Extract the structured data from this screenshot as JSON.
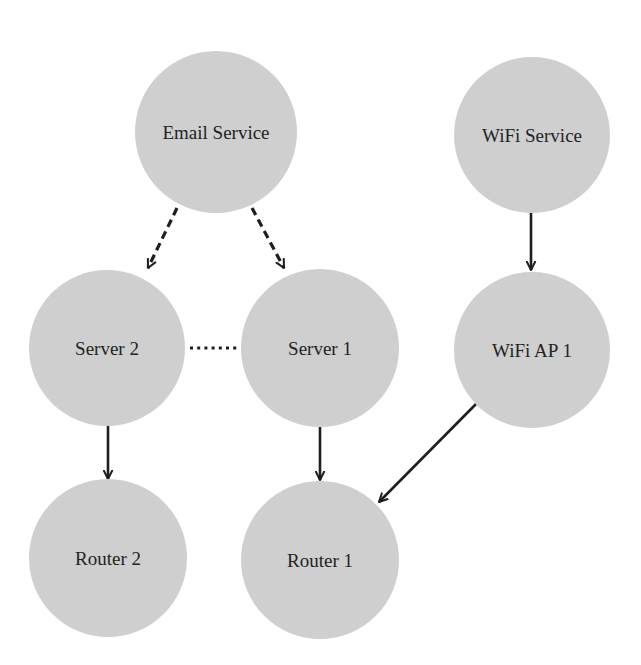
{
  "diagram": {
    "type": "directed-graph",
    "colors": {
      "background": "#ffffff",
      "node_fill": "#cfcfcf",
      "text": "#232323",
      "edge": "#1e1e1e"
    },
    "nodes": [
      {
        "id": "email",
        "label": "Email Service",
        "cx": 216,
        "cy": 132,
        "r": 81
      },
      {
        "id": "wifi_service",
        "label": "WiFi Service",
        "cx": 532,
        "cy": 135,
        "r": 78
      },
      {
        "id": "server2",
        "label": "Server 2",
        "cx": 107,
        "cy": 348,
        "r": 78
      },
      {
        "id": "server1",
        "label": "Server 1",
        "cx": 320,
        "cy": 348,
        "r": 79
      },
      {
        "id": "wifi_ap1",
        "label": "WiFi AP 1",
        "cx": 532,
        "cy": 350,
        "r": 78
      },
      {
        "id": "router2",
        "label": "Router 2",
        "cx": 108,
        "cy": 558,
        "r": 79
      },
      {
        "id": "router1",
        "label": "Router 1",
        "cx": 320,
        "cy": 560,
        "r": 79
      }
    ],
    "edges": [
      {
        "from": "email",
        "to": "server2",
        "style": "dashed",
        "directed": true,
        "x1": 177,
        "y1": 208,
        "x2": 148,
        "y2": 268
      },
      {
        "from": "email",
        "to": "server1",
        "style": "dashed",
        "directed": true,
        "x1": 252,
        "y1": 208,
        "x2": 284,
        "y2": 268
      },
      {
        "from": "server2",
        "to": "server1",
        "style": "dotted",
        "directed": false,
        "x1": 190,
        "y1": 348,
        "x2": 240,
        "y2": 348
      },
      {
        "from": "wifi_service",
        "to": "wifi_ap1",
        "style": "solid",
        "directed": true,
        "x1": 531,
        "y1": 213,
        "x2": 531,
        "y2": 270
      },
      {
        "from": "server2",
        "to": "router2",
        "style": "solid",
        "directed": true,
        "x1": 108,
        "y1": 426,
        "x2": 108,
        "y2": 479
      },
      {
        "from": "server1",
        "to": "router1",
        "style": "solid",
        "directed": true,
        "x1": 320,
        "y1": 427,
        "x2": 320,
        "y2": 480
      },
      {
        "from": "wifi_ap1",
        "to": "router1",
        "style": "solid",
        "directed": true,
        "x1": 476,
        "y1": 404,
        "x2": 379,
        "y2": 502
      }
    ]
  }
}
